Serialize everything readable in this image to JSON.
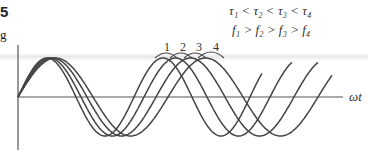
{
  "caption_fragments": {
    "figure_number": "5",
    "text": "g"
  },
  "relations": {
    "tau": "τ₁ < τ₂ < τ₃ < τ₄",
    "freq": "f₁ > f₂ > f₃ > f₄"
  },
  "axis": {
    "x_label": "ωt"
  },
  "curve_labels": [
    "1",
    "2",
    "3",
    "4"
  ],
  "colors": {
    "curve": "#444444",
    "axis": "#555555"
  }
}
